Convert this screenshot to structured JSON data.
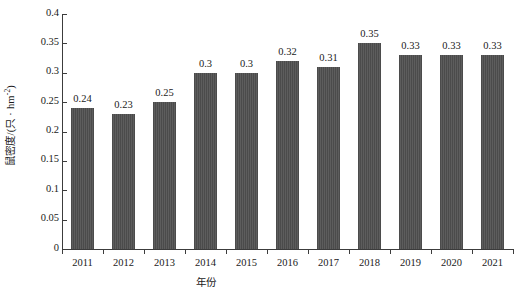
{
  "chart_data": {
    "type": "bar",
    "title": "",
    "xlabel": "年份",
    "ylabel": "鼠密度/(只·hm⁻²)",
    "ylabel_parts": {
      "prefix": "鼠密度/(只 · hm",
      "exponent": "-2",
      "suffix": ")"
    },
    "categories": [
      "2011",
      "2012",
      "2013",
      "2014",
      "2015",
      "2016",
      "2017",
      "2018",
      "2019",
      "2020",
      "2021"
    ],
    "values": [
      0.24,
      0.23,
      0.25,
      0.3,
      0.3,
      0.32,
      0.31,
      0.35,
      0.33,
      0.33,
      0.33
    ],
    "value_labels": [
      "0.24",
      "0.23",
      "0.25",
      "0.3",
      "0.3",
      "0.32",
      "0.31",
      "0.35",
      "0.33",
      "0.33",
      "0.33"
    ],
    "ylim": [
      0,
      0.4
    ],
    "yticks": [
      0,
      0.05,
      0.1,
      0.15,
      0.2,
      0.25,
      0.3,
      0.35,
      0.4
    ],
    "ytick_labels": [
      "0",
      "0.05",
      "0.1",
      "0.15",
      "0.2",
      "0.25",
      "0.3",
      "0.35",
      "0.4"
    ],
    "grid": false,
    "legend": false,
    "bar_color": "#4b4b4b",
    "axis_color": "#3c3c3c",
    "background": "#ffffff"
  }
}
